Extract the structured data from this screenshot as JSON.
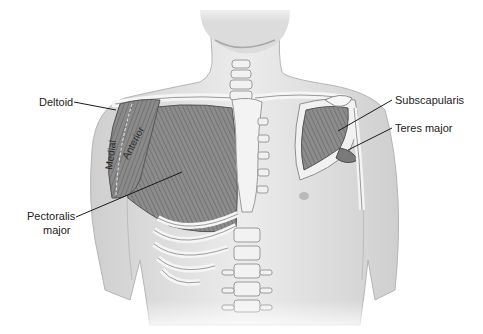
{
  "figure": {
    "type": "anatomical illustration",
    "labels": {
      "deltoid": "Deltoid",
      "deltoid_medial": "Medial",
      "deltoid_anterior": "Anterior",
      "pectoralis_line1": "Pectoralis",
      "pectoralis_line2": "major",
      "subscapularis": "Subscapularis",
      "teres_major": "Teres major"
    },
    "colors": {
      "background": "#ffffff",
      "skin": "#e6e6e6",
      "skin_shadow": "#bdbdbd",
      "muscle": "#8f8f8f",
      "muscle_dark": "#5e5e5e",
      "bone": "#f2f2f2",
      "leader_line": "#1a1a1a",
      "label_text": "#222222"
    }
  }
}
